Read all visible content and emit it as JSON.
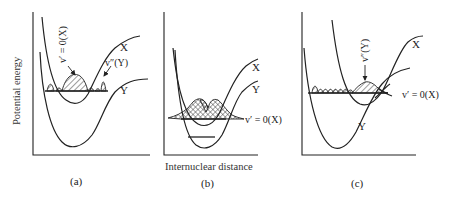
{
  "figure": {
    "y_axis_label": "Potential energy",
    "x_axis_label": "Internuclear distance",
    "panels": [
      {
        "id": "a",
        "caption": "(a)",
        "curve_labels": {
          "upper": "X",
          "lower": "Y"
        },
        "annotations": [
          "v′ = 0(X)",
          "v″(Y)"
        ]
      },
      {
        "id": "b",
        "caption": "(b)",
        "curve_labels": {
          "upper": "X",
          "lower": "Y"
        },
        "annotations": [
          "v′ = 0(X)"
        ]
      },
      {
        "id": "c",
        "caption": "(c)",
        "curve_labels": {
          "upper": "X",
          "lower": "Y"
        },
        "annotations": [
          "v″(Y)",
          "v′ = 0(X)"
        ]
      }
    ]
  }
}
